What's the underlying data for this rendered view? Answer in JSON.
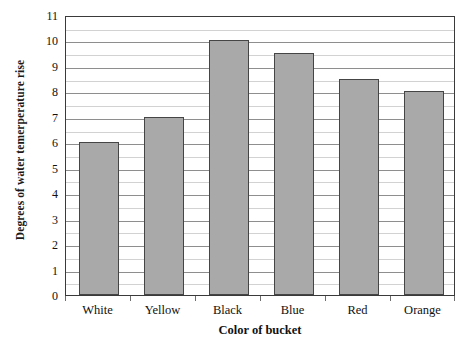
{
  "chart_data": {
    "type": "bar",
    "title": "",
    "categories": [
      "White",
      "Yellow",
      "Black",
      "Blue",
      "Red",
      "Orange"
    ],
    "values": [
      6,
      7,
      10,
      9.5,
      8.5,
      8
    ],
    "xlabel": "Color of bucket",
    "ylabel": "Degrees of water temerperature rise",
    "ylim": [
      0,
      11
    ],
    "y_major_ticks": [
      0,
      1,
      2,
      3,
      4,
      5,
      6,
      7,
      8,
      9,
      10,
      11
    ],
    "y_tick_labels": [
      "0",
      "1",
      "2",
      "3",
      "4",
      "5",
      "6",
      "7",
      "8",
      "9",
      "10",
      "11"
    ],
    "y_minor_ticks": [
      0.5,
      1.5,
      2.5,
      3.5,
      4.5,
      5.5,
      6.5,
      7.5,
      8.5,
      9.5,
      10.5
    ],
    "grid": true,
    "legend": false,
    "legend_position": "none",
    "bar_fill_color": "#a9a9a9",
    "bar_border_color": "#454545",
    "major_gridline_color": "#8e8e8e",
    "minor_gridline_color": "#d2d2d2",
    "plot_border_color": "#3a3a3a",
    "background_color": "#ffffff"
  }
}
